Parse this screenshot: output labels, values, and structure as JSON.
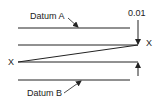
{
  "diagram": {
    "labels": {
      "datum_a": "Datum A",
      "datum_b": "Datum B",
      "tolerance": "0.01",
      "x_left": "X",
      "x_right": "X"
    },
    "colors": {
      "line": "#222222",
      "background": "#ffffff"
    }
  }
}
